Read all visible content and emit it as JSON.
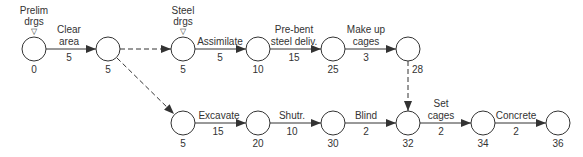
{
  "diagram": {
    "type": "activity-on-arrow network",
    "nodes": [
      {
        "id": "n0",
        "x": 34,
        "y": 49,
        "value": "0"
      },
      {
        "id": "n1",
        "x": 108,
        "y": 49,
        "value": "5"
      },
      {
        "id": "n2",
        "x": 183,
        "y": 49,
        "value": "5"
      },
      {
        "id": "n3",
        "x": 258,
        "y": 49,
        "value": "10"
      },
      {
        "id": "n4",
        "x": 333,
        "y": 49,
        "value": "25"
      },
      {
        "id": "n5",
        "x": 408,
        "y": 49,
        "value": "28"
      },
      {
        "id": "n6",
        "x": 183,
        "y": 123,
        "value": "5"
      },
      {
        "id": "n7",
        "x": 258,
        "y": 123,
        "value": "20"
      },
      {
        "id": "n8",
        "x": 333,
        "y": 123,
        "value": "30"
      },
      {
        "id": "n9",
        "x": 408,
        "y": 123,
        "value": "32"
      },
      {
        "id": "n10",
        "x": 483,
        "y": 123,
        "value": "34"
      },
      {
        "id": "n11",
        "x": 558,
        "y": 123,
        "value": "36"
      }
    ],
    "milestones": [
      {
        "node": "n0",
        "line1": "Prelim",
        "line2": "drgs",
        "marker": "▽"
      },
      {
        "node": "n2",
        "line1": "Steel",
        "line2": "drgs",
        "marker": "▽"
      }
    ],
    "activities": [
      {
        "from": "n0",
        "to": "n1",
        "line1": "Clear",
        "line2": "area",
        "duration": "5",
        "dummy": false
      },
      {
        "from": "n1",
        "to": "n2",
        "line1": "",
        "line2": "",
        "duration": "",
        "dummy": true
      },
      {
        "from": "n2",
        "to": "n3",
        "line1": "",
        "line2": "Assimilate",
        "duration": "5",
        "dummy": false
      },
      {
        "from": "n3",
        "to": "n4",
        "line1": "Pre-bent",
        "line2": "steel deliv.",
        "duration": "15",
        "dummy": false
      },
      {
        "from": "n4",
        "to": "n5",
        "line1": "Make up",
        "line2": "cages",
        "duration": "3",
        "dummy": false
      },
      {
        "from": "n1",
        "to": "n6",
        "line1": "",
        "line2": "",
        "duration": "",
        "dummy": true
      },
      {
        "from": "n5",
        "to": "n9",
        "line1": "",
        "line2": "",
        "duration": "",
        "dummy": true
      },
      {
        "from": "n6",
        "to": "n7",
        "line1": "",
        "line2": "Excavate",
        "duration": "15",
        "dummy": false
      },
      {
        "from": "n7",
        "to": "n8",
        "line1": "",
        "line2": "Shutr.",
        "duration": "10",
        "dummy": false
      },
      {
        "from": "n8",
        "to": "n9",
        "line1": "",
        "line2": "Blind",
        "duration": "2",
        "dummy": false
      },
      {
        "from": "n9",
        "to": "n10",
        "line1": "Set",
        "line2": "cages",
        "duration": "2",
        "dummy": false
      },
      {
        "from": "n10",
        "to": "n11",
        "line1": "",
        "line2": "Concrete",
        "duration": "2",
        "dummy": false
      }
    ]
  }
}
